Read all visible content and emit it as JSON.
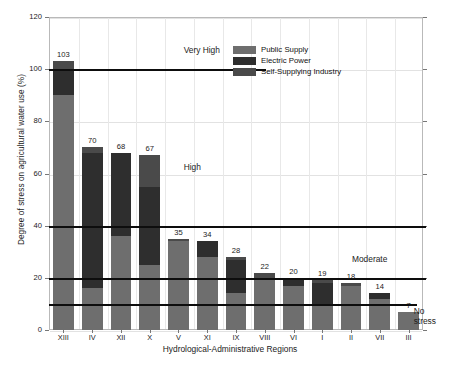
{
  "chart_data": {
    "type": "bar",
    "stacked": true,
    "title": "",
    "xlabel": "Hydrological-Administrative Regions",
    "ylabel": "Degree of stress on agricultural water use (%)",
    "ylim": [
      0,
      120
    ],
    "yticks": [
      0,
      20,
      40,
      60,
      80,
      100,
      120
    ],
    "grid": true,
    "legend_position": "top-right",
    "categories": [
      "XIII",
      "IV",
      "XII",
      "X",
      "V",
      "XI",
      "IX",
      "VIII",
      "VI",
      "I",
      "II",
      "VII",
      "III"
    ],
    "totals": [
      103,
      70,
      68,
      67,
      35,
      34,
      28,
      22,
      20,
      19,
      18,
      14,
      7
    ],
    "series": [
      {
        "name": "Public Supply",
        "color": "#6e6e6e",
        "values": [
          90,
          16,
          36,
          25,
          34,
          28,
          14,
          20,
          17,
          10,
          17,
          12,
          7
        ]
      },
      {
        "name": "Electric Power",
        "color": "#2e2e2e",
        "values": [
          10,
          52,
          32,
          30,
          0,
          6,
          13,
          0,
          2,
          8,
          0,
          2,
          0
        ]
      },
      {
        "name": "Self-Supplying Industry",
        "color": "#4a4a4a",
        "values": [
          3,
          2,
          0,
          12,
          1,
          0,
          1,
          2,
          1,
          1,
          1,
          0,
          0
        ]
      }
    ],
    "thresholds": [
      {
        "value": 100,
        "label": "Very High"
      },
      {
        "value": 40,
        "label": "High"
      },
      {
        "value": 20,
        "label": "Moderate"
      },
      {
        "value": 10,
        "label": "No stress"
      }
    ],
    "zone_labels": [
      {
        "text": "Very High",
        "value": 107,
        "x_fraction": 0.36
      },
      {
        "text": "High",
        "value": 62,
        "x_fraction": 0.36
      },
      {
        "text": "Moderate",
        "value": 27,
        "x_fraction": 0.81
      },
      {
        "text": "No",
        "text2": "stress",
        "value": 7,
        "x_fraction": 0.975
      }
    ]
  },
  "legend": {
    "items": [
      {
        "label": "Public Supply"
      },
      {
        "label": "Electric Power"
      },
      {
        "label": "Self-Supplying Industry"
      }
    ]
  }
}
